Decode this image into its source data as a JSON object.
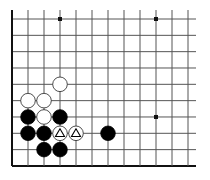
{
  "board": {
    "description": "Go board diagram, lower-left corner section",
    "origin_x": 12,
    "origin_y": 19,
    "spacing_x": 16,
    "spacing_y": 16.33,
    "cols": 12,
    "rows": 10,
    "line_right_end": 196,
    "line_top_start": 10,
    "edges": {
      "left": true,
      "bottom": true,
      "top": false,
      "right": false
    },
    "colors": {
      "line": "#555555",
      "edge": "#111111",
      "black_stone": "#000000",
      "white_stone": "#ffffff",
      "stone_outline": "#222222"
    },
    "star_points": [
      {
        "col": 3,
        "row": 0
      },
      {
        "col": 9,
        "row": 0
      },
      {
        "col": 9,
        "row": 6
      }
    ],
    "stones": [
      {
        "color": "white",
        "col": 3,
        "row": 4
      },
      {
        "color": "white",
        "col": 1,
        "row": 5
      },
      {
        "color": "white",
        "col": 2,
        "row": 5
      },
      {
        "color": "white",
        "col": 2,
        "row": 6
      },
      {
        "color": "black",
        "col": 1,
        "row": 6
      },
      {
        "color": "black",
        "col": 3,
        "row": 6
      },
      {
        "color": "black",
        "col": 1,
        "row": 7
      },
      {
        "color": "black",
        "col": 2,
        "row": 7
      },
      {
        "color": "black",
        "col": 2,
        "row": 8
      },
      {
        "color": "black",
        "col": 3,
        "row": 8
      },
      {
        "color": "black",
        "col": 6,
        "row": 7
      },
      {
        "color": "white",
        "col": 3,
        "row": 7,
        "mark": "triangle"
      },
      {
        "color": "white",
        "col": 4,
        "row": 7,
        "mark": "triangle"
      }
    ]
  }
}
